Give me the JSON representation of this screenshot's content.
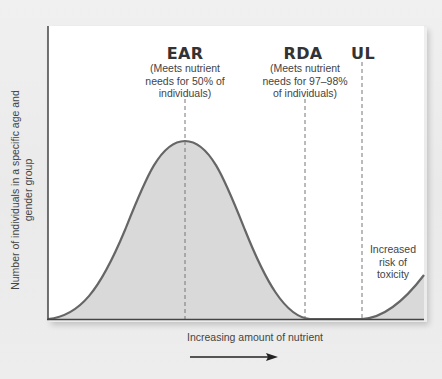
{
  "diagram": {
    "y_axis_label": "Number of individuals in a specific age and gender group",
    "x_axis_label": "Increasing amount of nutrient",
    "markers": [
      {
        "id": "ear",
        "title": "EAR",
        "description": "(Meets nutrient\nneeds for 50% of\nindividuals)"
      },
      {
        "id": "rda",
        "title": "RDA",
        "description": "(Meets nutrient\nneeds for 97–98%\nof individuals)"
      },
      {
        "id": "ul",
        "title": "UL",
        "description": ""
      }
    ],
    "toxicity_note": "Increased\nrisk of\ntoxicity",
    "colors": {
      "background": "#ececec",
      "panel": "#ffffff",
      "curve": "#666666",
      "fill": "#d9d9d9",
      "axis": "#444444",
      "dashed": "#777777"
    }
  }
}
